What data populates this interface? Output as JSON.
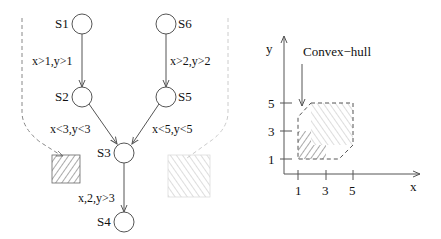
{
  "graph": {
    "states": [
      {
        "id": "S1",
        "label": "S1"
      },
      {
        "id": "S6",
        "label": "S6"
      },
      {
        "id": "S2",
        "label": "S2"
      },
      {
        "id": "S5",
        "label": "S5"
      },
      {
        "id": "S3",
        "label": "S3"
      },
      {
        "id": "S4",
        "label": "S4"
      }
    ],
    "edges": [
      {
        "from": "S1",
        "to": "S2",
        "label": "x>1,y>1"
      },
      {
        "from": "S6",
        "to": "S5",
        "label": "x>2,y>2"
      },
      {
        "from": "S2",
        "to": "S3",
        "label": "x<3,y<3"
      },
      {
        "from": "S5",
        "to": "S3",
        "label": "x<5,y<5"
      },
      {
        "from": "S3",
        "to": "S4",
        "label": "x,2,y>3"
      }
    ],
    "regions": [
      {
        "name": "region-s1-s2-s3",
        "hatch": "dark"
      },
      {
        "name": "region-s6-s5-s3",
        "hatch": "light"
      }
    ]
  },
  "plot": {
    "xlabel": "x",
    "ylabel": "y",
    "x_ticks": [
      "1",
      "3",
      "5"
    ],
    "y_ticks": [
      "1",
      "3",
      "5"
    ],
    "annotation": "Convex−hull"
  },
  "colors": {
    "line": "#555555",
    "dark_hatch": "#555555",
    "light_hatch": "#bbbbbb",
    "dashed": "#888888",
    "light_dashed": "#cccccc"
  }
}
